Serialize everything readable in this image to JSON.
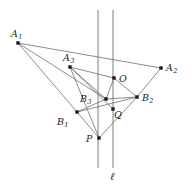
{
  "figure": {
    "type": "geometry-diagram",
    "width": 192,
    "height": 190,
    "colors": {
      "stroke": "#6f6f6f",
      "point": "#1a1a1a",
      "label": "#1a1a1a",
      "background": "#ffffff"
    },
    "points": [
      {
        "id": "A1",
        "base": "A",
        "sub": "1",
        "x": 18,
        "y": 43,
        "lx": 11,
        "ly": 29
      },
      {
        "id": "A3",
        "base": "A",
        "sub": "3",
        "x": 70,
        "y": 67,
        "lx": 63,
        "ly": 53
      },
      {
        "id": "A2",
        "base": "A",
        "sub": "2",
        "x": 161,
        "y": 68,
        "lx": 166,
        "ly": 63
      },
      {
        "id": "O",
        "base": "O",
        "sub": "",
        "x": 114,
        "y": 78,
        "lx": 119,
        "ly": 74
      },
      {
        "id": "B3",
        "base": "B",
        "sub": "3",
        "x": 106,
        "y": 99,
        "lx": 80,
        "ly": 94
      },
      {
        "id": "B2",
        "base": "B",
        "sub": "2",
        "x": 137,
        "y": 97,
        "lx": 142,
        "ly": 93
      },
      {
        "id": "Q",
        "base": "Q",
        "sub": "",
        "x": 113,
        "y": 109,
        "lx": 114,
        "ly": 110
      },
      {
        "id": "B1",
        "base": "B",
        "sub": "1",
        "x": 77,
        "y": 112,
        "lx": 57,
        "ly": 117
      },
      {
        "id": "P",
        "base": "P",
        "sub": "",
        "x": 99,
        "y": 138,
        "lx": 86,
        "ly": 134
      }
    ],
    "vertical_lines": [
      {
        "id": "v1",
        "x": 98,
        "y1": 10,
        "y2": 168
      },
      {
        "id": "v2",
        "x": 113,
        "y1": 10,
        "y2": 168,
        "label": "ℓ",
        "lx": 110,
        "ly": 171
      }
    ],
    "segments": [
      {
        "from": "A1",
        "to": "A2"
      },
      {
        "from": "A1",
        "to": "B3"
      },
      {
        "from": "A1",
        "to": "B1"
      },
      {
        "from": "A3",
        "to": "O"
      },
      {
        "from": "A3",
        "to": "B3"
      },
      {
        "from": "A3",
        "to": "Q"
      },
      {
        "from": "O",
        "to": "B3"
      },
      {
        "from": "O",
        "to": "B2"
      },
      {
        "from": "B3",
        "to": "B2"
      },
      {
        "from": "B3",
        "to": "B1"
      },
      {
        "from": "B1",
        "to": "B2"
      },
      {
        "from": "B1",
        "to": "P"
      },
      {
        "from": "P",
        "to": "B2"
      },
      {
        "from": "A3",
        "to": "P"
      },
      {
        "from": "A2",
        "to": "B2"
      }
    ],
    "line_label": "ℓ"
  }
}
